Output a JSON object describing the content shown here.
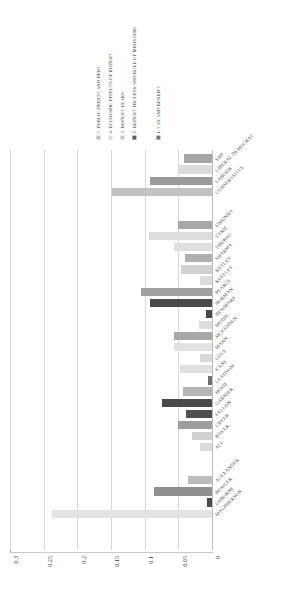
{
  "chart_data": {
    "type": "bar",
    "orientation": "horizontal",
    "title": "",
    "xlabel": "",
    "ylabel": "",
    "xlim": [
      0,
      0.3
    ],
    "x_ticks": [
      "0",
      "0.05",
      "0.1",
      "0.15",
      "0.2",
      "0.25",
      "0.3"
    ],
    "x_tick_values": [
      0,
      0.05,
      0.1,
      0.15,
      0.2,
      0.25,
      0.3
    ],
    "axis_direction": "right-to-left",
    "grid": true,
    "legend_position": "top",
    "stacked": false,
    "series": [
      {
        "name": "1. TAX AND BENEFIT",
        "color": "#404040"
      },
      {
        "name": "2. BUDGET PROCESS AND ROLE OF MINISTERS",
        "color": "#7f7f7f"
      },
      {
        "name": "3. BUDGET LEAKS",
        "color": "#a6a6a6"
      },
      {
        "name": "4. ECONOMIC EFFECTS OF BUDGET",
        "color": "#d9d9d9"
      },
      {
        "name": "5. PUBLIC DEFICIT AND DEBT",
        "color": "#bfbfbf"
      }
    ],
    "categories": [
      "SNP",
      "LIBERAL DEMOCRAT",
      "LABOUR",
      "CONSERVATIVE",
      "UMUNNA",
      "TYRIE",
      "THURSO",
      "SHARMA",
      "RUTLEY",
      "RUFFLEY",
      "PEARCE",
      "NORMAN",
      "NEWMARK",
      "MUDIE",
      "MCFADDEN",
      "MANN",
      "LOVE",
      "KANE",
      "LEADSOM",
      "HOSIE",
      "GARNIER",
      "FALLON",
      "CRYER",
      "BAKER",
      "ALI",
      "ALEXANDER",
      "BOWLER",
      "OSBORNE",
      "MACPHERSON"
    ],
    "bars": [
      {
        "category": "SNP",
        "series": "3. BUDGET LEAKS",
        "value": 0.041,
        "color": "#a6a6a6",
        "row": 0
      },
      {
        "category": "LIBERAL DEMOCRAT",
        "series": "4. ECONOMIC EFFECTS OF BUDGET",
        "value": 0.051,
        "color": "#dcdcdc",
        "row": 1
      },
      {
        "category": "LABOUR",
        "series": "2. BUDGET PROCESS AND ROLE OF MINISTERS",
        "value": 0.092,
        "color": "#9a9a9a",
        "row": 2
      },
      {
        "category": "CONSERVATIVE",
        "series": "1. TAX AND BENEFIT",
        "value": 0.057,
        "color": "#4a4a4a",
        "row": 3
      },
      {
        "category": "CONSERVATIVE",
        "series": "3. BUDGET LEAKS",
        "value": 0.148,
        "color": "#c3c3c3",
        "row": 3
      },
      {
        "category": "UMUNNA",
        "series": "3. BUDGET LEAKS",
        "value": 0.051,
        "color": "#a8a8a8",
        "row": 6
      },
      {
        "category": "TYRIE",
        "series": "4. ECONOMIC EFFECTS OF BUDGET",
        "value": 0.093,
        "color": "#dddddd",
        "row": 7
      },
      {
        "category": "THURSO",
        "series": "4. ECONOMIC EFFECTS OF BUDGET",
        "value": 0.057,
        "color": "#e0e0e0",
        "row": 8
      },
      {
        "category": "SHARMA",
        "series": "3. BUDGET LEAKS",
        "value": 0.04,
        "color": "#b0b0b0",
        "row": 9
      },
      {
        "category": "RUTLEY",
        "series": "1. TAX AND BENEFIT",
        "value": 0.027,
        "color": "#3f3f3f",
        "row": 10
      },
      {
        "category": "RUTLEY",
        "series": "3. BUDGET LEAKS",
        "value": 0.046,
        "color": "#d2d2d2",
        "row": 10
      },
      {
        "category": "RUFFLEY",
        "series": "4. ECONOMIC EFFECTS OF BUDGET",
        "value": 0.018,
        "color": "#dcdcdc",
        "row": 11
      },
      {
        "category": "PEARCE",
        "series": "2. BUDGET PROCESS AND ROLE OF MINISTERS",
        "value": 0.105,
        "color": "#a0a0a0",
        "row": 12
      },
      {
        "category": "NORMAN",
        "series": "1. TAX AND BENEFIT",
        "value": 0.092,
        "color": "#4a4a4a",
        "row": 13
      },
      {
        "category": "NEWMARK",
        "series": "1. TAX AND BENEFIT",
        "value": 0.009,
        "color": "#474747",
        "row": 14
      },
      {
        "category": "MUDIE",
        "series": "4. ECONOMIC EFFECTS OF BUDGET",
        "value": 0.019,
        "color": "#dddddd",
        "row": 15
      },
      {
        "category": "MCFADDEN",
        "series": "3. BUDGET LEAKS",
        "value": 0.057,
        "color": "#a8a8a8",
        "row": 16
      },
      {
        "category": "MANN",
        "series": "1. TAX AND BENEFIT",
        "value": 0.031,
        "color": "#8a8a8a",
        "row": 17
      },
      {
        "category": "MANN",
        "series": "4. ECONOMIC EFFECTS OF BUDGET",
        "value": 0.056,
        "color": "#e2e2e2",
        "row": 17
      },
      {
        "category": "LOVE",
        "series": "4. ECONOMIC EFFECTS OF BUDGET",
        "value": 0.018,
        "color": "#d9d9d9",
        "row": 18
      },
      {
        "category": "KANE",
        "series": "4. ECONOMIC EFFECTS OF BUDGET",
        "value": 0.048,
        "color": "#e0e0e0",
        "row": 19
      },
      {
        "category": "LEADSOM",
        "series": "1. TAX AND BENEFIT",
        "value": 0.006,
        "color": "#6f6f6f",
        "row": 20
      },
      {
        "category": "HOSIE",
        "series": "3. BUDGET LEAKS",
        "value": 0.043,
        "color": "#b5b5b5",
        "row": 21
      },
      {
        "category": "GARNIER",
        "series": "1. TAX AND BENEFIT",
        "value": 0.075,
        "color": "#4a4a4a",
        "row": 22
      },
      {
        "category": "FALLON",
        "series": "1. TAX AND BENEFIT",
        "value": 0.039,
        "color": "#4f4f4f",
        "row": 23
      },
      {
        "category": "CRYER",
        "series": "2. BUDGET PROCESS AND ROLE OF MINISTERS",
        "value": 0.05,
        "color": "#9e9e9e",
        "row": 24
      },
      {
        "category": "BAKER",
        "series": "3. BUDGET LEAKS",
        "value": 0.03,
        "color": "#d0d0d0",
        "row": 25
      },
      {
        "category": "ALI",
        "series": "4. ECONOMIC EFFECTS OF BUDGET",
        "value": 0.018,
        "color": "#dcdcdc",
        "row": 26
      },
      {
        "category": "ALEXANDER",
        "series": "3. BUDGET LEAKS",
        "value": 0.036,
        "color": "#bdbdbd",
        "row": 29
      },
      {
        "category": "BOWLER",
        "series": "2. BUDGET PROCESS AND ROLE OF MINISTERS",
        "value": 0.086,
        "color": "#8f8f8f",
        "row": 30
      },
      {
        "category": "OSBORNE",
        "series": "1. TAX AND BENEFIT",
        "value": 0.007,
        "color": "#4a4a4a",
        "row": 31
      },
      {
        "category": "MACPHERSON",
        "series": "1. TAX AND BENEFIT",
        "value": 0.2,
        "color": "#404040",
        "row": 32
      },
      {
        "category": "MACPHERSON",
        "series": "4. ECONOMIC EFFECTS OF BUDGET",
        "value": 0.238,
        "color": "#e3e3e3",
        "row": 32
      }
    ]
  },
  "legend": {
    "items": [
      {
        "label": "5. PUBLIC DEFICIT AND DEBT",
        "color": "#bfbfbf"
      },
      {
        "label": "4. ECONOMIC EFFECTS OF BUDGET",
        "color": "#dcdcdc"
      },
      {
        "label": "3. BUDGET LEAKS",
        "color": "#c8c8c8"
      },
      {
        "label": "2. BUDGET PROCESS AND ROLE OF MINISTERS",
        "color": "#5d5d5d"
      },
      {
        "label": "1. TAX AND BENEFIT",
        "color": "#7a7a7a"
      }
    ]
  }
}
